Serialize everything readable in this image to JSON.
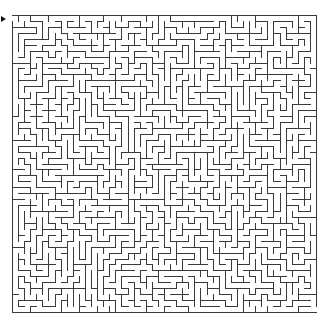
{
  "maze": {
    "cols": 50,
    "rows": 50,
    "width_px": 304,
    "height_px": 297,
    "wall_color": "#3a3a3a",
    "background_color": "#ffffff",
    "wall_width": 1,
    "entrance": {
      "side": "left",
      "row": 0
    },
    "exit": {
      "side": "right",
      "row": 49
    },
    "entry_marker_icon": "arrow-right-icon",
    "seed": 7919
  }
}
